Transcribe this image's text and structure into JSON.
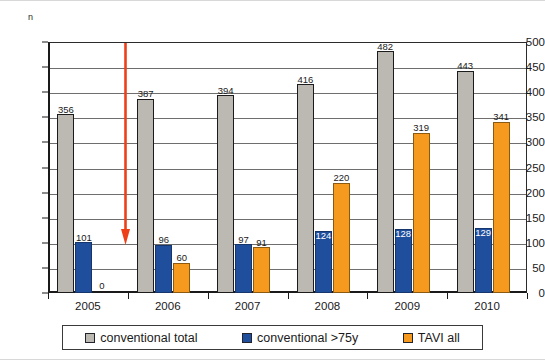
{
  "chart_data": {
    "type": "bar",
    "title": "",
    "xlabel": "",
    "ylabel": "n",
    "ylim": [
      0,
      500
    ],
    "yticks": [
      0,
      50,
      100,
      150,
      200,
      250,
      300,
      350,
      400,
      450,
      500
    ],
    "grid": true,
    "legend_position": "bottom",
    "categories": [
      "2005",
      "2006",
      "2007",
      "2008",
      "2009",
      "2010"
    ],
    "series": [
      {
        "name": "conventional total",
        "color": "#bcb9b2",
        "values": [
          356,
          387,
          394,
          416,
          482,
          443
        ]
      },
      {
        "name": "conventional >75y",
        "color": "#1f4e9c",
        "values": [
          101,
          96,
          97,
          124,
          128,
          129
        ]
      },
      {
        "name": "TAVI all",
        "color": "#f59a1e",
        "values": [
          0,
          60,
          91,
          220,
          319,
          341
        ]
      }
    ],
    "annotations": [
      {
        "name": "red-down-arrow",
        "color": "#ee4018",
        "x_category": "2005/2006 boundary",
        "y_from": 500,
        "y_to": 100
      }
    ]
  },
  "axes": {
    "y_unit_label": "n",
    "y_tick_labels": [
      "500",
      "450",
      "400",
      "350",
      "300",
      "250",
      "200",
      "150",
      "100",
      "50",
      "0"
    ],
    "x_tick_labels": [
      "2005",
      "2006",
      "2007",
      "2008",
      "2009",
      "2010"
    ]
  },
  "value_labels": {
    "total": [
      "356",
      "387",
      "394",
      "416",
      "482",
      "443"
    ],
    "over75": [
      "101",
      "96",
      "97",
      "124",
      "128",
      "129"
    ],
    "tavi": [
      "0",
      "60",
      "91",
      "220",
      "319",
      "341"
    ]
  },
  "legend": {
    "items": [
      {
        "label": "conventional total",
        "color": "#bcb9b2"
      },
      {
        "label": "conventional >75y",
        "color": "#1f4e9c"
      },
      {
        "label": "TAVI all",
        "color": "#f59a1e"
      }
    ]
  }
}
